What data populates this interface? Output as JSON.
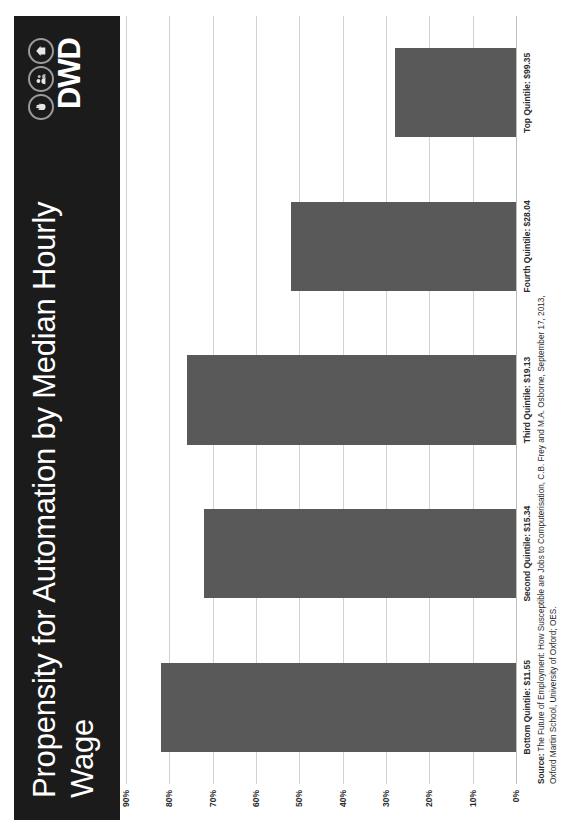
{
  "poster": {
    "title": "Propensity for Automation by Median Hourly Wage",
    "logo": {
      "wordmark": "DWD",
      "icon_names": [
        "hand-circle-icon",
        "people-circle-icon",
        "home-circle-icon"
      ]
    }
  },
  "chart_data": {
    "type": "bar",
    "title": "Propensity for Automation by Median Hourly Wage",
    "xlabel": "",
    "ylabel": "",
    "categories": [
      "Bottom Quintile: $11.55",
      "Second Quintile: $15.34",
      "Third Quintile: $19.13",
      "Fourth Quintile: $28.04",
      "Top Quintile: $99.35"
    ],
    "values": [
      82,
      72,
      76,
      52,
      28
    ],
    "value_labels": [
      "82%",
      "72%",
      "76%",
      "52%",
      "28%"
    ],
    "ylim": [
      0,
      90
    ],
    "ytick_labels": [
      "0%",
      "10%",
      "20%",
      "30%",
      "40%",
      "50%",
      "60%",
      "70%",
      "80%",
      "90%"
    ],
    "ytick_values": [
      0,
      10,
      20,
      30,
      40,
      50,
      60,
      70,
      80,
      90
    ],
    "grid": true,
    "legend": "none",
    "bar_color": "#595959",
    "gridline_color": "#d2d2d2"
  },
  "source": {
    "label": "Source:",
    "line1": " The Future of Employment: How Susceptible are Jobs to Computerisation, C.B. Frey and M.A. Osborne, September 17, 2013,",
    "line2": "Oxford Martin School, University of Oxford; OES."
  },
  "colors": {
    "banner_background": "#1b1b1b",
    "banner_text": "#ffffff",
    "bar": "#595959",
    "grid": "#d2d2d2",
    "text": "#2b2b2b"
  }
}
